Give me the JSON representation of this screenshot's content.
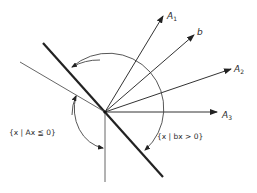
{
  "diagram": {
    "origin": [
      105,
      112
    ],
    "colors": {
      "line": "#222222",
      "thin": "#555555",
      "background": "#ffffff"
    },
    "vectors": [
      {
        "name": "A",
        "sub": "1",
        "tip": [
          163,
          16
        ],
        "label_pos": [
          167,
          19
        ]
      },
      {
        "name": "b",
        "sub": "",
        "tip": [
          194,
          35
        ],
        "label_pos": [
          198,
          35
        ]
      },
      {
        "name": "A",
        "sub": "2",
        "tip": [
          231,
          69
        ],
        "label_pos": [
          234,
          72
        ]
      },
      {
        "name": "A",
        "sub": "3",
        "tip": [
          217,
          112
        ],
        "label_pos": [
          222,
          118
        ]
      }
    ],
    "lines": {
      "hyperplane_b": {
        "from": [
          43,
          43
        ],
        "to": [
          163,
          177
        ]
      },
      "cone_edge_upper": {
        "from": [
          20,
          62
        ],
        "to": [
          105,
          112
        ]
      },
      "cone_edge_lower": {
        "from": [
          105,
          112
        ],
        "to": [
          105,
          182
        ]
      }
    },
    "labels": {
      "set_ax": "{x | Ax ≦ 0}",
      "set_bx": "{x | bx > 0}"
    }
  }
}
